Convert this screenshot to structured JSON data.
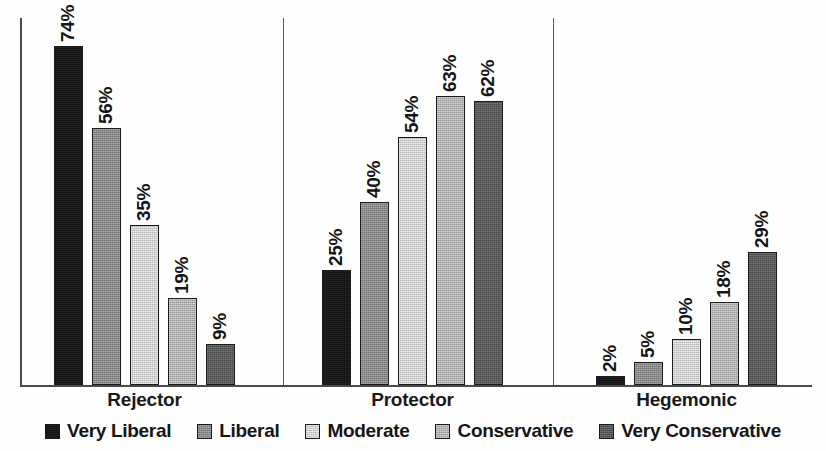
{
  "chart_data": {
    "type": "bar",
    "title": "",
    "subtitle": "",
    "xlabel": "",
    "ylabel": "",
    "grid": false,
    "ylim": [
      0,
      80
    ],
    "legend_position": "bottom",
    "value_suffix": "%",
    "categories": [
      "Rejector",
      "Protector",
      "Hegemonic"
    ],
    "series": [
      {
        "name": "Very Liberal",
        "color": "#141414",
        "swatch_class": "sw-very-liberal",
        "values": [
          74,
          25,
          2
        ],
        "labels": [
          "74%",
          "25%",
          "2%"
        ]
      },
      {
        "name": "Liberal",
        "color": "#8d8d8d",
        "swatch_class": "sw-liberal",
        "values": [
          56,
          40,
          5
        ],
        "labels": [
          "56%",
          "40%",
          "5%"
        ]
      },
      {
        "name": "Moderate",
        "color": "#dedede",
        "swatch_class": "sw-moderate",
        "values": [
          35,
          54,
          10
        ],
        "labels": [
          "35%",
          "54%",
          "10%"
        ]
      },
      {
        "name": "Conservative",
        "color": "#b9b9b9",
        "swatch_class": "sw-conservative",
        "values": [
          19,
          63,
          18
        ],
        "labels": [
          "19%",
          "63%",
          "18%"
        ]
      },
      {
        "name": "Very Conservative",
        "color": "#575757",
        "swatch_class": "sw-very-conservative",
        "values": [
          9,
          62,
          29
        ],
        "labels": [
          "9%",
          "62%",
          "29%"
        ]
      }
    ]
  },
  "axes": {
    "axis_color": "#4a4a4a",
    "divider_color": "#565656"
  }
}
